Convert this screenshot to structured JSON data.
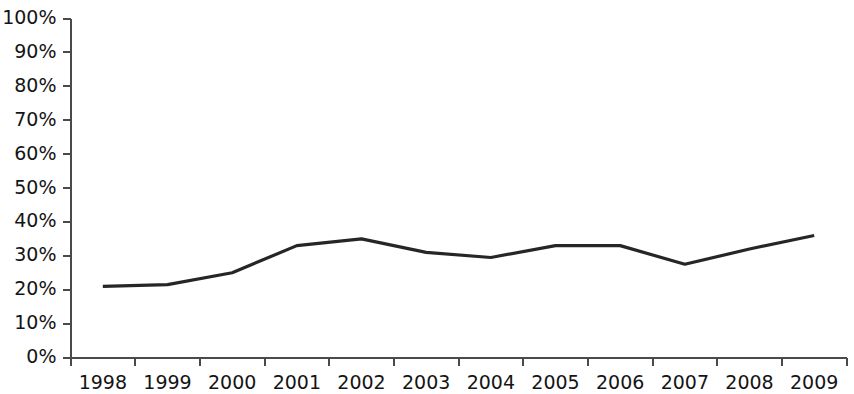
{
  "chart_data": {
    "type": "line",
    "title": "",
    "subtitle": "",
    "xlabel": "",
    "ylabel": "",
    "categories": [
      "1998",
      "1999",
      "2000",
      "2001",
      "2002",
      "2003",
      "2004",
      "2005",
      "2006",
      "2007",
      "2008",
      "2009"
    ],
    "values": [
      21,
      21.5,
      25,
      33,
      35,
      31,
      29.5,
      33,
      33,
      27.5,
      32,
      36
    ],
    "series": [
      {
        "name": "",
        "values": [
          21,
          21.5,
          25,
          33,
          35,
          31,
          29.5,
          33,
          33,
          27.5,
          32,
          36
        ]
      }
    ],
    "ylim": [
      0,
      100
    ],
    "ytick_labels": [
      "0%",
      "10%",
      "20%",
      "30%",
      "40%",
      "50%",
      "60%",
      "70%",
      "80%",
      "90%",
      "100%"
    ],
    "ytick_values": [
      0,
      10,
      20,
      30,
      40,
      50,
      60,
      70,
      80,
      90,
      100
    ],
    "xtick_labels": [
      "1998",
      "1999",
      "2000",
      "2001",
      "2002",
      "2003",
      "2004",
      "2005",
      "2006",
      "2007",
      "2008",
      "2009"
    ],
    "grid": false,
    "legend": false,
    "legend_position": "none",
    "annotations": [],
    "line_color": "#262626",
    "axis_color": "#4a4a4a",
    "background_color": "#ffffff"
  }
}
